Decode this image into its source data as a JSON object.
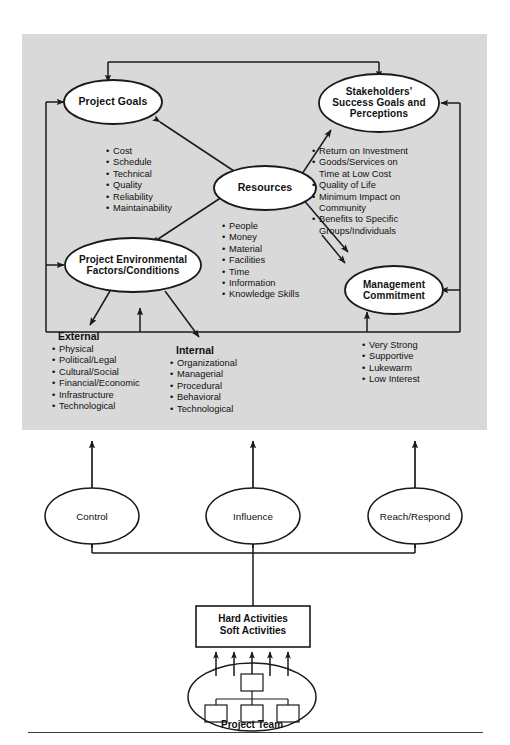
{
  "diagram": {
    "panel_color": "#d9d9d9",
    "line_color": "#1a1a1a",
    "nodes": {
      "project_goals": {
        "label": "Project Goals"
      },
      "stakeholders": {
        "label": "Stakeholders'\nSuccess Goals and\nPerceptions",
        "line1": "Stakeholders'",
        "line2": "Success Goals and",
        "line3": "Perceptions"
      },
      "resources": {
        "label": "Resources"
      },
      "project_env": {
        "line1": "Project Environmental",
        "line2": "Factors/Conditions"
      },
      "management": {
        "line1": "Management",
        "line2": "Commitment"
      },
      "control": {
        "label": "Control"
      },
      "influence": {
        "label": "Influence"
      },
      "reach_respond": {
        "label": "Reach/Respond"
      },
      "activities": {
        "line1": "Hard Activities",
        "line2": "Soft Activities"
      },
      "project_team": {
        "label": "Project Team"
      }
    },
    "lists": {
      "project_goals_items": [
        "Cost",
        "Schedule",
        "Technical",
        "Quality",
        "Reliability",
        "Maintainability"
      ],
      "stakeholder_items": [
        {
          "text": "Return on Investment"
        },
        {
          "text": "Goods/Services on",
          "cont": "Time at Low Cost"
        },
        {
          "text": "Quality of Life"
        },
        {
          "text": "Minimum Impact on",
          "cont": "Community"
        },
        {
          "text": "Benefits to Specific",
          "cont": "Groups/Individuals"
        }
      ],
      "resource_items": [
        "People",
        "Money",
        "Material",
        "Facilities",
        "Time",
        "Information",
        "Knowledge Skills"
      ],
      "external": {
        "heading": "External",
        "items": [
          "Physical",
          "Political/Legal",
          "Cultural/Social",
          "Financial/Economic",
          "Infrastructure",
          "Technological"
        ]
      },
      "internal": {
        "heading": "Internal",
        "items": [
          "Organizational",
          "Managerial",
          "Procedural",
          "Behavioral",
          "Technological"
        ]
      },
      "management_items": [
        "Very Strong",
        "Supportive",
        "Lukewarm",
        "Low Interest"
      ]
    }
  }
}
